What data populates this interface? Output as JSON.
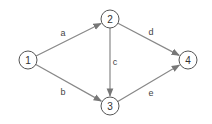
{
  "diagram": {
    "type": "directed-graph",
    "nodes": [
      {
        "id": "1",
        "label": "1",
        "x": 28,
        "y": 60
      },
      {
        "id": "2",
        "label": "2",
        "x": 110,
        "y": 19
      },
      {
        "id": "3",
        "label": "3",
        "x": 110,
        "y": 106
      },
      {
        "id": "4",
        "label": "4",
        "x": 188,
        "y": 60
      }
    ],
    "edges": [
      {
        "from": "1",
        "to": "2",
        "label": "a",
        "lx": 63,
        "ly": 33
      },
      {
        "from": "1",
        "to": "3",
        "label": "b",
        "lx": 63,
        "ly": 92
      },
      {
        "from": "2",
        "to": "3",
        "label": "c",
        "lx": 115,
        "ly": 62
      },
      {
        "from": "2",
        "to": "4",
        "label": "d",
        "lx": 151,
        "ly": 32
      },
      {
        "from": "3",
        "to": "4",
        "label": "e",
        "lx": 151,
        "ly": 93
      }
    ],
    "colors": {
      "edge": "#888888",
      "node_stroke": "#555555",
      "text": "#333333"
    }
  }
}
